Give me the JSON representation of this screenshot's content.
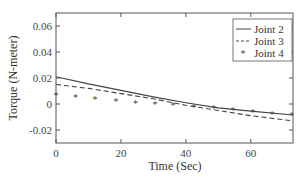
{
  "chart_data": {
    "type": "line",
    "title": "",
    "xlabel": "Time (Sec)",
    "ylabel": "Torque (N-meter)",
    "xlim": [
      0,
      73
    ],
    "ylim": [
      -0.03,
      0.07
    ],
    "xticks": [
      0,
      20,
      40,
      60
    ],
    "yticks": [
      -0.02,
      0,
      0.02,
      0.04,
      0.06
    ],
    "ytick_labels": [
      "-0.02",
      "0",
      "0.02",
      "0.04",
      "0.06"
    ],
    "xtick_labels": [
      "0",
      "20",
      "40",
      "60"
    ],
    "grid": false,
    "legend_position": "upper right",
    "series": [
      {
        "name": "Joint 2",
        "style": "solid",
        "x": [
          0,
          10,
          20,
          30,
          40,
          50,
          60,
          73
        ],
        "values": [
          0.021,
          0.0155,
          0.0105,
          0.0055,
          0.001,
          -0.003,
          -0.0055,
          -0.0085
        ]
      },
      {
        "name": "Joint 3",
        "style": "dashed",
        "x": [
          0,
          10,
          20,
          30,
          40,
          50,
          60,
          73
        ],
        "values": [
          0.015,
          0.012,
          0.008,
          0.004,
          -0.001,
          -0.005,
          -0.009,
          -0.013
        ]
      },
      {
        "name": "Joint 4",
        "style": "markers",
        "x": [
          0,
          6,
          12,
          18.5,
          24.5,
          30.5,
          36,
          42.5,
          48.6,
          54.5,
          60.6,
          66.5,
          72.6
        ],
        "values": [
          0.007,
          0.0055,
          0.004,
          0.0025,
          0.001,
          0.0,
          -0.001,
          -0.0025,
          -0.003,
          -0.0045,
          -0.006,
          -0.0075,
          -0.0085
        ]
      }
    ]
  },
  "colors": {
    "axis": "#555555",
    "line": "#444444",
    "background": "#ffffff"
  }
}
